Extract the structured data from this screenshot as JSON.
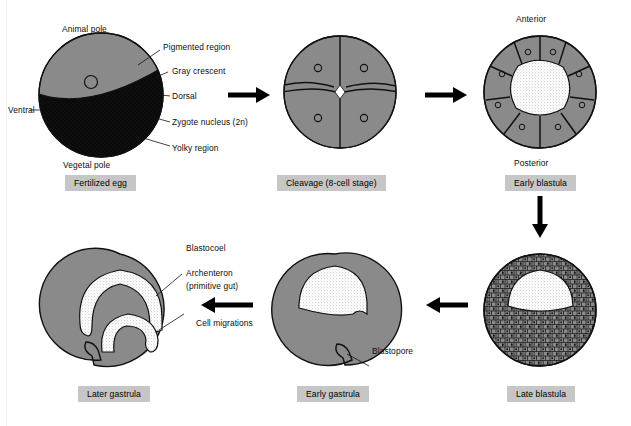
{
  "figure": {
    "background_color": "#ffffff",
    "cytoplasm_color": "#8a8a8a",
    "yolk_color": "#0a0a0a",
    "cavity_color": "#ffffff",
    "caption_bg": "#c6c6c6",
    "outline_color": "#111111"
  },
  "stages": [
    {
      "id": "fertilized-egg",
      "caption": "Fertilized egg",
      "labels": [
        {
          "name": "animal-pole",
          "text": "Animal pole"
        },
        {
          "name": "pigmented-region",
          "text": "Pigmented region"
        },
        {
          "name": "gray-crescent",
          "text": "Gray crescent"
        },
        {
          "name": "dorsal",
          "text": "Dorsal"
        },
        {
          "name": "zygote-nucleus",
          "text": "Zygote nucleus (2n)"
        },
        {
          "name": "yolky-region",
          "text": "Yolky region"
        },
        {
          "name": "vegetal-pole",
          "text": "Vegetal pole"
        },
        {
          "name": "ventral",
          "text": "Ventral"
        }
      ]
    },
    {
      "id": "cleavage",
      "caption": "Cleavage (8-cell stage)",
      "labels": []
    },
    {
      "id": "early-blastula",
      "caption": "Early blastula",
      "labels": [
        {
          "name": "anterior",
          "text": "Anterior"
        },
        {
          "name": "posterior",
          "text": "Posterior"
        }
      ]
    },
    {
      "id": "late-blastula",
      "caption": "Late blastula",
      "labels": []
    },
    {
      "id": "early-gastrula",
      "caption": "Early gastrula",
      "labels": [
        {
          "name": "blastopore",
          "text": "Blastopore"
        }
      ]
    },
    {
      "id": "later-gastrula",
      "caption": "Later gastrula",
      "labels": [
        {
          "name": "blastocoel",
          "text": "Blastocoel"
        },
        {
          "name": "archenteron",
          "text": "Archenteron"
        },
        {
          "name": "primitive-gut",
          "text": "(primitive gut)"
        },
        {
          "name": "cell-migrations",
          "text": "Cell migrations"
        }
      ]
    }
  ],
  "flow": {
    "arrow_1": "right",
    "arrow_2": "right",
    "arrow_3": "down",
    "arrow_4": "left",
    "arrow_5": "left"
  }
}
